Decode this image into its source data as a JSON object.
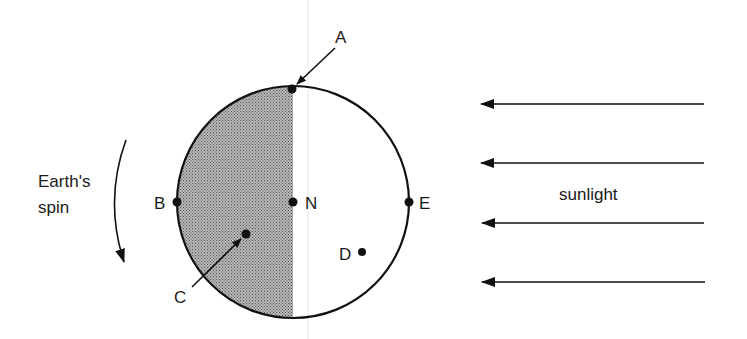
{
  "diagram": {
    "labels": {
      "A": "A",
      "B": "B",
      "C": "C",
      "D": "D",
      "E": "E",
      "N": "N",
      "spin_line1": "Earth's",
      "spin_line2": "spin",
      "sunlight": "sunlight"
    },
    "colors": {
      "outline": "#111111",
      "night_shading": "#8a8a8a",
      "background": "#ffffff",
      "guide_line": "#e4e4e4"
    },
    "earth": {
      "cx": 293,
      "cy": 202,
      "r": 116
    },
    "points": [
      {
        "id": "A",
        "x": 292,
        "y": 89
      },
      {
        "id": "B",
        "x": 177,
        "y": 202
      },
      {
        "id": "N",
        "x": 293,
        "y": 202
      },
      {
        "id": "E",
        "x": 409,
        "y": 202
      },
      {
        "id": "C",
        "x": 246,
        "y": 234
      },
      {
        "id": "D",
        "x": 362,
        "y": 252
      }
    ],
    "sunlight_arrows_count": 4
  }
}
